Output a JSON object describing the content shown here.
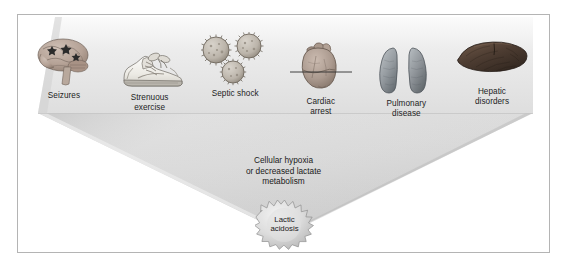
{
  "figure": {
    "top_caption": "",
    "causes": [
      {
        "id": "seizures",
        "label": "Seizures",
        "icon": "brain-icon"
      },
      {
        "id": "exercise",
        "label": "Strenuous\nexercise",
        "icon": "running-shoe-icon"
      },
      {
        "id": "septic",
        "label": "Septic shock",
        "icon": "bacteria-icon"
      },
      {
        "id": "cardiac",
        "label": "Cardiac\narrest",
        "icon": "heart-flatline-icon"
      },
      {
        "id": "pulmonary",
        "label": "Pulmonary\ndisease",
        "icon": "lungs-icon"
      },
      {
        "id": "hepatic",
        "label": "Hepatic\ndisorders",
        "icon": "liver-icon"
      }
    ],
    "mechanism_caption": "Cellular hypoxia\nor decreased lactate\nmetabolism",
    "outcome_badge": {
      "label": "Lactic\nacidosis",
      "shape": "starburst"
    },
    "colors": {
      "frame_border": "#b4b4b4",
      "funnel_light": "#f2f2f2",
      "funnel_mid": "#d8d8d8",
      "funnel_dark": "#c2c2c2",
      "text": "#1a1a1a",
      "brain": "#b9a79c",
      "shoe": "#e2e0db",
      "bacteria": "#bdb6ae",
      "heart": "#b0a199",
      "lungs": "#9fa4a8",
      "liver": "#5c4a3d",
      "badge_fill": "#d9d9d9"
    }
  }
}
